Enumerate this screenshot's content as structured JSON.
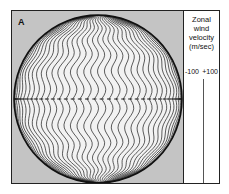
{
  "figure": {
    "panel_label": "A",
    "colors": {
      "panel_background": "#c4c4c4",
      "globe_fill": "#f2f2f2",
      "line": "#1a1a1a",
      "legend_background": "#ffffff"
    }
  },
  "legend": {
    "title_lines": [
      "Zonal",
      "wind",
      "velocity",
      "(m/sec)"
    ],
    "tick_min": "-100",
    "tick_max": "+100"
  }
}
